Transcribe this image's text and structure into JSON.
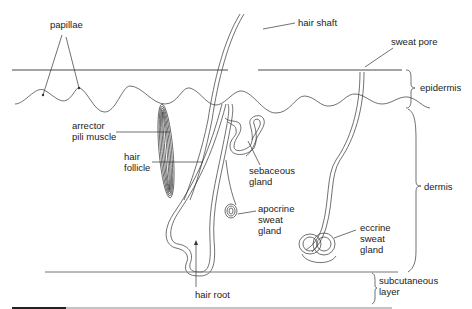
{
  "diagram": {
    "labels": {
      "papillae": "papillae",
      "hair_shaft": "hair shaft",
      "sweat_pore": "sweat pore",
      "epidermis": "epidermis",
      "arrector_1": "arrector",
      "arrector_2": "pili muscle",
      "follicle_1": "hair",
      "follicle_2": "follicle",
      "sebaceous_1": "sebaceous",
      "sebaceous_2": "gland",
      "dermis": "dermis",
      "apocrine_1": "apocrine",
      "apocrine_2": "sweat",
      "apocrine_3": "gland",
      "eccrine_1": "eccrine",
      "eccrine_2": "sweat",
      "eccrine_3": "gland",
      "subcutaneous_1": "subcutaneous",
      "subcutaneous_2": "layer",
      "hair_root": "hair root"
    },
    "layers": [
      "epidermis",
      "dermis",
      "subcutaneous layer"
    ],
    "colors": {
      "line": "#333333",
      "text": "#222222",
      "background": "#ffffff"
    }
  }
}
